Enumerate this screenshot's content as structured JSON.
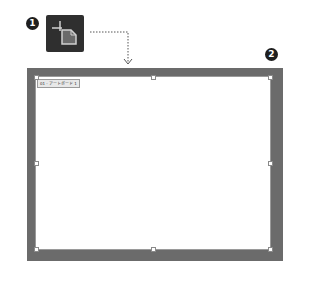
{
  "callouts": {
    "step1": "1",
    "step2": "2"
  },
  "tool": {
    "icon": "artboard-tool-icon",
    "background_color": "#2f2f2f",
    "glyph_color": "#d0d0d0"
  },
  "connector": {
    "style": "dotted",
    "arrow": "chevron-down"
  },
  "canvas": {
    "frame_color": "#6b6b6b",
    "artboard_color": "#ffffff",
    "artboard_label": "01 - アートボード 1"
  },
  "handles": [
    "top-left",
    "top-center",
    "top-right",
    "middle-left",
    "middle-right",
    "bottom-left",
    "bottom-center",
    "bottom-right"
  ]
}
